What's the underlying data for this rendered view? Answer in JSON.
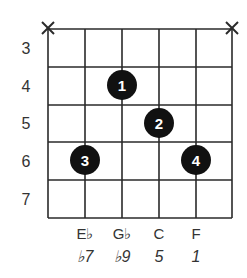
{
  "chord_diagram": {
    "type": "guitar-chord-chart",
    "strings_muted": [
      {
        "string": 6,
        "marker": "X"
      },
      {
        "string": 1,
        "marker": "X"
      }
    ],
    "frets": [
      "3",
      "4",
      "5",
      "6",
      "7"
    ],
    "fingers": [
      {
        "finger": "1",
        "string": 4,
        "fret": 4
      },
      {
        "finger": "2",
        "string": 3,
        "fret": 5
      },
      {
        "finger": "3",
        "string": 5,
        "fret": 6
      },
      {
        "finger": "4",
        "string": 2,
        "fret": 6
      }
    ],
    "notes": [
      {
        "name": "E♭",
        "interval": "♭7"
      },
      {
        "name": "G♭",
        "interval": "♭9"
      },
      {
        "name": "C",
        "interval": "5"
      },
      {
        "name": "F",
        "interval": "1"
      }
    ],
    "colors": {
      "grid": "#2a2a2a",
      "dot": "#111111",
      "dot_text": "#ffffff"
    }
  }
}
